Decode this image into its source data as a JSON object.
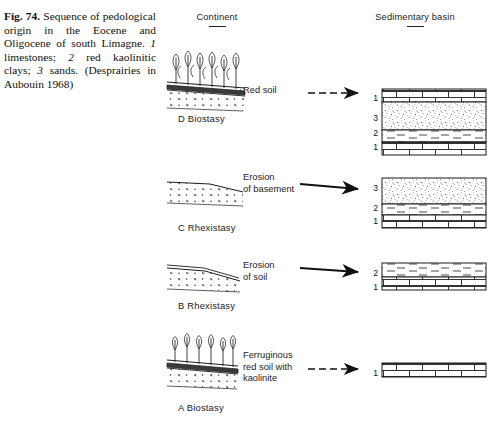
{
  "figure": {
    "number": "Fig. 74.",
    "caption_parts": {
      "lead": "Fig. 74.",
      "text_1": " Sequence of pedological origin in the Eocene and Oligocene of south Limagne. ",
      "key_1_num": "1",
      "key_1_txt": " limestones; ",
      "key_2_num": "2",
      "key_2_txt": " red kaolinitic clays; ",
      "key_3_num": "3",
      "key_3_txt": " sands. (Desprairies in Aubouin 1968)"
    },
    "full_caption": "Fig. 74. Sequence of pedological origin in the Eocene and Oligocene of south Limagne. 1 limestones; 2 red kaolinitic clays; 3 sands. (Desprairies in Aubouin 1968)"
  },
  "headers": {
    "left": "Continent",
    "right": "Sedimentary basin"
  },
  "legend_keys": [
    {
      "num": "1",
      "label": "limestones"
    },
    {
      "num": "2",
      "label": "red kaolinitic clays"
    },
    {
      "num": "3",
      "label": "sands"
    }
  ],
  "panels": [
    {
      "id": "D",
      "label": "D  Biostasy",
      "stage_letter": "D",
      "stage_name": "Biostasy",
      "annotation": "Red soil",
      "arrow_style": "dashed",
      "vegetation": true,
      "basin_layers": [
        {
          "num": "1",
          "lithology": "limestone"
        },
        {
          "num": "3",
          "lithology": "sand"
        },
        {
          "num": "2",
          "lithology": "clay"
        },
        {
          "num": "1",
          "lithology": "limestone"
        }
      ]
    },
    {
      "id": "C",
      "label": "C  Rhexistasy",
      "stage_letter": "C",
      "stage_name": "Rhexistasy",
      "annotation": "Erosion\nof basement",
      "arrow_style": "solid",
      "vegetation": false,
      "basin_layers": [
        {
          "num": "3",
          "lithology": "sand"
        },
        {
          "num": "2",
          "lithology": "clay"
        },
        {
          "num": "1",
          "lithology": "limestone"
        }
      ]
    },
    {
      "id": "B",
      "label": "B  Rhexistasy",
      "stage_letter": "B",
      "stage_name": "Rhexistasy",
      "annotation": "Erosion\nof soil",
      "arrow_style": "solid",
      "vegetation": false,
      "basin_layers": [
        {
          "num": "2",
          "lithology": "clay"
        },
        {
          "num": "1",
          "lithology": "limestone"
        }
      ]
    },
    {
      "id": "A",
      "label": "A  Biostasy",
      "stage_letter": "A",
      "stage_name": "Biostasy",
      "annotation": "Ferruginous\nred soil with\nkaolinite",
      "arrow_style": "dashed",
      "vegetation": true,
      "basin_layers": [
        {
          "num": "1",
          "lithology": "limestone"
        }
      ]
    }
  ],
  "colors": {
    "ink": "#1a1a1a",
    "background": "#ffffff",
    "soil_band": "#2b2b2b"
  }
}
